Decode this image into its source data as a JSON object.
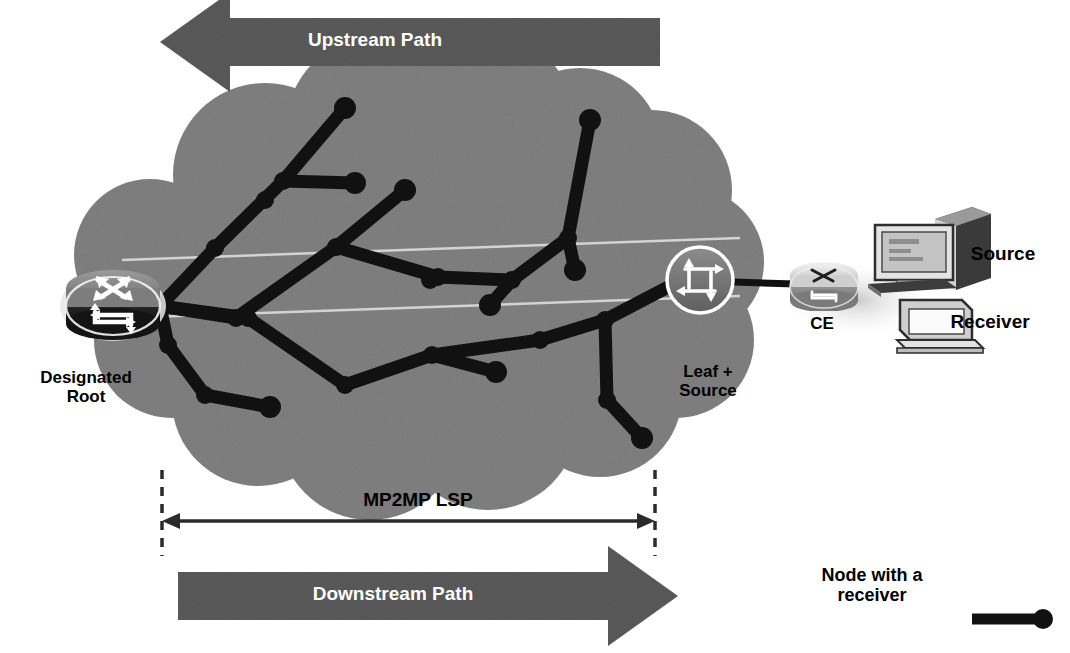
{
  "figure": {
    "type": "network-diagram",
    "background_color": "#ffffff"
  },
  "colors": {
    "cloud_fill": "#808080",
    "arrow_fill": "#5a5a5a",
    "tree_stroke": "#111111",
    "node_fill": "#111111",
    "text": "#000000",
    "arrow_text": "#ffffff",
    "scan_line": "#d8d8d8",
    "dim_line": "#2b2b2b",
    "icon_outline": "#ffffff",
    "ce_fill": "#b4b4b4",
    "host_fill": "#dcdcdc"
  },
  "arrows": {
    "upstream": {
      "label": "Upstream Path",
      "direction": "left",
      "x": 160,
      "y": 18,
      "width": 500,
      "height": 48
    },
    "downstream": {
      "label": "Downstream Path",
      "direction": "right",
      "x": 178,
      "y": 572,
      "width": 500,
      "height": 48
    }
  },
  "measure": {
    "label": "MP2MP LSP",
    "label_x": 418,
    "label_y": 489,
    "line_y": 521,
    "left_x": 162,
    "right_x": 655,
    "tick_top": 470,
    "tick_bottom": 556
  },
  "labels": [
    {
      "name": "designated-root-label",
      "text": "Designated\nRoot",
      "x": 86,
      "y": 368,
      "size": 17,
      "align": "center"
    },
    {
      "name": "leaf-source-label",
      "text": "Leaf +\nSource",
      "x": 708,
      "y": 362,
      "size": 17,
      "align": "center"
    },
    {
      "name": "ce-label",
      "text": "CE",
      "x": 822,
      "y": 314,
      "size": 17,
      "align": "center"
    },
    {
      "name": "source-label",
      "text": "Source",
      "x": 1003,
      "y": 243,
      "size": 19,
      "align": "center"
    },
    {
      "name": "receiver-label",
      "text": "Receiver",
      "x": 990,
      "y": 311,
      "size": 19,
      "align": "center"
    }
  ],
  "legend": {
    "text": "Node with a\nreceiver",
    "text_x": 872,
    "text_y": 565,
    "text_size": 16,
    "sample_line": {
      "x1": 972,
      "y1": 619,
      "x2": 1040,
      "y2": 619,
      "width": 11
    },
    "sample_dot": {
      "cx": 1043,
      "cy": 619,
      "r": 10
    }
  },
  "nodes": {
    "designated_root": {
      "name": "designated-root-router",
      "cx": 113,
      "cy": 306,
      "rx": 47,
      "ry": 29,
      "icon": "router-icon"
    },
    "leaf_source": {
      "name": "leaf-source-node",
      "cx": 700,
      "cy": 280,
      "r": 32,
      "icon": "multilayer-switch-icon"
    },
    "ce": {
      "name": "ce-router",
      "cx": 823,
      "cy": 286,
      "rx": 33,
      "ry": 21,
      "icon": "router-icon"
    },
    "source": {
      "name": "source-workstation",
      "x": 873,
      "y": 207,
      "w": 112,
      "h": 86,
      "icon": "workstation-icon"
    },
    "receiver": {
      "name": "receiver-pc",
      "x": 898,
      "y": 288,
      "w": 88,
      "h": 62,
      "icon": "pc-icon"
    }
  },
  "links": [
    {
      "from": "leaf_source",
      "to": "ce",
      "x1": 734,
      "y1": 282,
      "x2": 795,
      "y2": 284
    }
  ],
  "cloud": {
    "name": "provider-cloud",
    "bumps": [
      {
        "cx": 265,
        "cy": 175,
        "r": 92
      },
      {
        "cx": 378,
        "cy": 128,
        "r": 92
      },
      {
        "cx": 487,
        "cy": 122,
        "r": 88
      },
      {
        "cx": 580,
        "cy": 150,
        "r": 82
      },
      {
        "cx": 652,
        "cy": 190,
        "r": 80
      },
      {
        "cx": 690,
        "cy": 262,
        "r": 74
      },
      {
        "cx": 676,
        "cy": 340,
        "r": 78
      },
      {
        "cx": 600,
        "cy": 395,
        "r": 82
      },
      {
        "cx": 488,
        "cy": 420,
        "r": 90
      },
      {
        "cx": 370,
        "cy": 428,
        "r": 92
      },
      {
        "cx": 258,
        "cy": 400,
        "r": 86
      },
      {
        "cx": 172,
        "cy": 340,
        "r": 78
      },
      {
        "cx": 150,
        "cy": 255,
        "r": 76
      },
      {
        "cx": 420,
        "cy": 280,
        "r": 170
      },
      {
        "cx": 300,
        "cy": 290,
        "r": 130
      },
      {
        "cx": 560,
        "cy": 280,
        "r": 135
      }
    ]
  },
  "scan_lines": [
    {
      "x1": 122,
      "y1": 260,
      "x2": 740,
      "y2": 238
    },
    {
      "x1": 122,
      "y1": 318,
      "x2": 740,
      "y2": 296
    }
  ],
  "chart_data": {
    "type": "diagram",
    "tree_nodes": [
      {
        "id": "root",
        "x": 160,
        "y": 306,
        "receiver": false
      },
      {
        "id": "a1",
        "x": 215,
        "y": 248,
        "receiver": false
      },
      {
        "id": "a2",
        "x": 265,
        "y": 200,
        "receiver": false
      },
      {
        "id": "a3",
        "x": 283,
        "y": 181,
        "receiver": false
      },
      {
        "id": "a4",
        "x": 345,
        "y": 108,
        "receiver": true
      },
      {
        "id": "a5",
        "x": 355,
        "y": 183,
        "receiver": true
      },
      {
        "id": "b1",
        "x": 236,
        "y": 318,
        "receiver": false
      },
      {
        "id": "b2",
        "x": 336,
        "y": 247,
        "receiver": false
      },
      {
        "id": "b3",
        "x": 405,
        "y": 190,
        "receiver": true
      },
      {
        "id": "b4",
        "x": 430,
        "y": 280,
        "receiver": false
      },
      {
        "id": "b5",
        "x": 490,
        "y": 305,
        "receiver": true
      },
      {
        "id": "c1",
        "x": 438,
        "y": 277,
        "receiver": false
      },
      {
        "id": "c2",
        "x": 512,
        "y": 280,
        "receiver": false
      },
      {
        "id": "c3",
        "x": 568,
        "y": 238,
        "receiver": false
      },
      {
        "id": "c4",
        "x": 590,
        "y": 120,
        "receiver": true
      },
      {
        "id": "c5",
        "x": 575,
        "y": 270,
        "receiver": true
      },
      {
        "id": "d1",
        "x": 168,
        "y": 345,
        "receiver": false
      },
      {
        "id": "d2",
        "x": 205,
        "y": 395,
        "receiver": false
      },
      {
        "id": "d3",
        "x": 270,
        "y": 407,
        "receiver": true
      },
      {
        "id": "e1",
        "x": 248,
        "y": 318,
        "receiver": false
      },
      {
        "id": "e2",
        "x": 345,
        "y": 385,
        "receiver": false
      },
      {
        "id": "e3",
        "x": 432,
        "y": 355,
        "receiver": false
      },
      {
        "id": "e4",
        "x": 496,
        "y": 372,
        "receiver": true
      },
      {
        "id": "e5",
        "x": 540,
        "y": 340,
        "receiver": false
      },
      {
        "id": "e6",
        "x": 605,
        "y": 320,
        "receiver": false
      },
      {
        "id": "e7",
        "x": 607,
        "y": 400,
        "receiver": false
      },
      {
        "id": "e8",
        "x": 642,
        "y": 438,
        "receiver": true
      },
      {
        "id": "leaf",
        "x": 672,
        "y": 285,
        "receiver": false
      }
    ],
    "tree_edges": [
      [
        "root",
        "a1"
      ],
      [
        "a1",
        "a3"
      ],
      [
        "a3",
        "a4"
      ],
      [
        "a3",
        "a5"
      ],
      [
        "root",
        "b1"
      ],
      [
        "b1",
        "b2"
      ],
      [
        "b2",
        "b3"
      ],
      [
        "b2",
        "c1"
      ],
      [
        "c1",
        "c2"
      ],
      [
        "c2",
        "c3"
      ],
      [
        "c3",
        "c4"
      ],
      [
        "c3",
        "c5"
      ],
      [
        "c2",
        "b5"
      ],
      [
        "root",
        "d1"
      ],
      [
        "d1",
        "d2"
      ],
      [
        "d2",
        "d3"
      ],
      [
        "root",
        "e1"
      ],
      [
        "e1",
        "e2"
      ],
      [
        "e2",
        "e3"
      ],
      [
        "e3",
        "e4"
      ],
      [
        "e3",
        "e5"
      ],
      [
        "e5",
        "e6"
      ],
      [
        "e6",
        "leaf"
      ],
      [
        "e6",
        "e7"
      ],
      [
        "e7",
        "e8"
      ]
    ],
    "receiver_node_count": 9
  }
}
